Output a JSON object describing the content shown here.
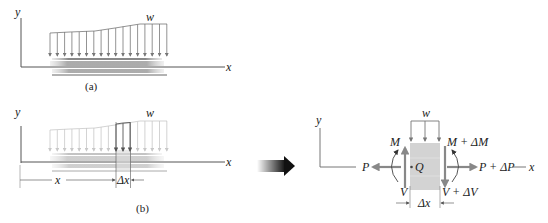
{
  "figure": {
    "part_a": {
      "caption": "(a)",
      "axis_y": "y",
      "axis_x": "x",
      "load_label": "w",
      "load_arrow_count": 17
    },
    "part_b": {
      "caption": "(b)",
      "axis_y": "y",
      "axis_x": "x",
      "load_label": "w",
      "dim_x": "x",
      "dim_dx": "Δx"
    },
    "free_body": {
      "axis_y": "y",
      "axis_x": "x",
      "load_label": "w",
      "point": "Q",
      "left_axial": "P",
      "right_axial": "P + ΔP",
      "left_moment": "M",
      "right_moment": "M + ΔM",
      "left_shear": "V",
      "right_shear": "V + ΔV",
      "width_label": "Δx"
    },
    "transition_arrow": "arrow-right-icon"
  }
}
